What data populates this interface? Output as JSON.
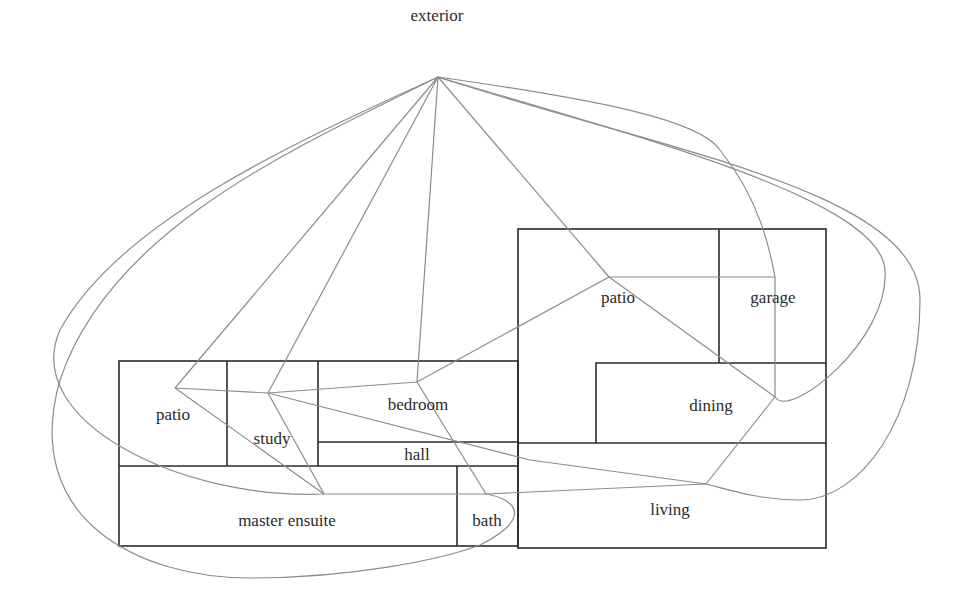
{
  "diagram": {
    "type": "floor-plan-adjacency-graph",
    "colors": {
      "walls": "#2a2a2a",
      "edges": "#8c8c8c",
      "text": "#2b2b2b",
      "background": "#ffffff"
    },
    "rooms": [
      {
        "id": "exterior",
        "label": "exterior"
      },
      {
        "id": "patio_left",
        "label": "patio"
      },
      {
        "id": "study",
        "label": "study"
      },
      {
        "id": "bedroom",
        "label": "bedroom"
      },
      {
        "id": "hall",
        "label": "hall"
      },
      {
        "id": "master_ensuite",
        "label": "master ensuite"
      },
      {
        "id": "bath",
        "label": "bath"
      },
      {
        "id": "patio_right",
        "label": "patio"
      },
      {
        "id": "garage",
        "label": "garage"
      },
      {
        "id": "dining",
        "label": "dining"
      },
      {
        "id": "living",
        "label": "living"
      }
    ],
    "edges": [
      [
        "exterior",
        "patio_left"
      ],
      [
        "exterior",
        "study"
      ],
      [
        "exterior",
        "bedroom"
      ],
      [
        "exterior",
        "patio_right"
      ],
      [
        "exterior",
        "garage"
      ],
      [
        "exterior",
        "dining"
      ],
      [
        "exterior",
        "living"
      ],
      [
        "exterior",
        "master_ensuite"
      ],
      [
        "exterior",
        "bath"
      ],
      [
        "patio_left",
        "study"
      ],
      [
        "patio_left",
        "master_ensuite"
      ],
      [
        "study",
        "bedroom"
      ],
      [
        "study",
        "master_ensuite"
      ],
      [
        "study",
        "living"
      ],
      [
        "bedroom",
        "patio_right"
      ],
      [
        "bedroom",
        "bath"
      ],
      [
        "master_ensuite",
        "bath"
      ],
      [
        "bath",
        "living"
      ],
      [
        "patio_right",
        "garage"
      ],
      [
        "patio_right",
        "dining"
      ],
      [
        "garage",
        "dining"
      ],
      [
        "dining",
        "living"
      ]
    ]
  }
}
